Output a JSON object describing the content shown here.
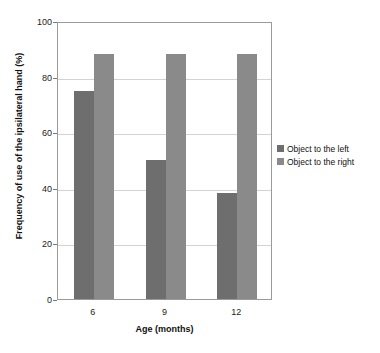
{
  "chart_data": {
    "type": "bar",
    "title": "",
    "subtitle": "",
    "xlabel": "Age (months)",
    "ylabel": "Frequency of use of the ipsilateral hand (%)",
    "categories": [
      "6",
      "9",
      "12"
    ],
    "series": [
      {
        "name": "Object to the left",
        "color": "#6e6e6e",
        "values": [
          75,
          50,
          38
        ]
      },
      {
        "name": "Object to the right",
        "color": "#8a8a8a",
        "values": [
          88,
          88,
          88
        ]
      }
    ],
    "ylim": [
      0,
      100
    ],
    "yticks": [
      0,
      20,
      40,
      60,
      80,
      100
    ],
    "ytick_labels": [
      "0",
      "20",
      "40",
      "60",
      "80",
      "100"
    ],
    "grid": true,
    "grid_axis": "y",
    "legend_position": "right",
    "background_color": "#ffffff",
    "frame_color": "#9a9a9a"
  },
  "legend": {
    "entries": [
      {
        "label": "Object to the left",
        "color": "#6e6e6e"
      },
      {
        "label": "Object to the right",
        "color": "#8a8a8a"
      }
    ]
  }
}
